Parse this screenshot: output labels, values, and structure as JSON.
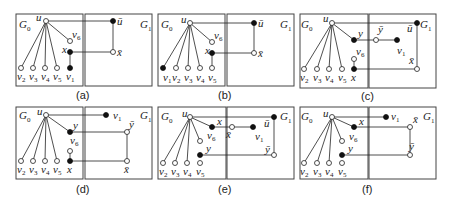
{
  "figure": {
    "panels": [
      {
        "id": "a",
        "caption": "(a)"
      },
      {
        "id": "b",
        "caption": "(b)"
      },
      {
        "id": "c",
        "caption": "(c)"
      },
      {
        "id": "d",
        "caption": "(d)"
      },
      {
        "id": "e",
        "caption": "(e)"
      },
      {
        "id": "f",
        "caption": "(f)"
      }
    ],
    "labels": {
      "g0": "G",
      "g0_sub": "0",
      "g1": "G",
      "g1_sub": "1",
      "u": "u",
      "u_bar": "ū",
      "x": "x",
      "x_bar": "x̄",
      "y": "y",
      "y_bar": "ȳ",
      "v": "v",
      "s1": "1",
      "s2": "2",
      "s3": "3",
      "s4": "4",
      "s5": "5",
      "s6": "6"
    }
  }
}
